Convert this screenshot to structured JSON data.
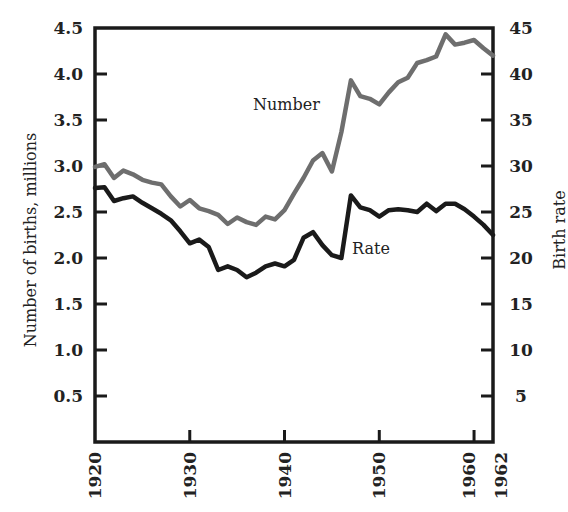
{
  "chart_data": {
    "type": "line",
    "title": "",
    "xlabel": "",
    "ylabel": "Number of births, millions",
    "y2label": "Birth rate",
    "x_ticks": [
      "1920",
      "1930",
      "1940",
      "1950",
      "1960",
      "1962"
    ],
    "y_ticks": [
      "0.5",
      "1.0",
      "1.5",
      "2.0",
      "2.5",
      "3.0",
      "3.5",
      "4.0",
      "4.5"
    ],
    "y2_ticks": [
      "5",
      "10",
      "15",
      "20",
      "25",
      "30",
      "35",
      "40",
      "45"
    ],
    "xlim": [
      1920,
      1962
    ],
    "ylim": [
      0,
      4.5
    ],
    "y2lim": [
      0,
      45
    ],
    "grid": false,
    "annotations": [
      {
        "text": "Number",
        "series": "Number"
      },
      {
        "text": "Rate",
        "series": "Rate"
      }
    ],
    "x": [
      1920,
      1921,
      1922,
      1923,
      1924,
      1925,
      1926,
      1927,
      1928,
      1929,
      1930,
      1931,
      1932,
      1933,
      1934,
      1935,
      1936,
      1937,
      1938,
      1939,
      1940,
      1941,
      1942,
      1943,
      1944,
      1945,
      1946,
      1947,
      1948,
      1949,
      1950,
      1951,
      1952,
      1953,
      1954,
      1955,
      1956,
      1957,
      1958,
      1959,
      1960,
      1961,
      1962
    ],
    "series": [
      {
        "name": "Number",
        "axis": "left",
        "unit": "millions",
        "color": "#6e6e6e",
        "values": [
          2.99,
          3.02,
          2.87,
          2.95,
          2.91,
          2.85,
          2.82,
          2.8,
          2.67,
          2.56,
          2.63,
          2.54,
          2.51,
          2.47,
          2.37,
          2.44,
          2.39,
          2.36,
          2.45,
          2.42,
          2.52,
          2.7,
          2.87,
          3.06,
          3.14,
          2.94,
          3.37,
          3.93,
          3.76,
          3.73,
          3.67,
          3.8,
          3.91,
          3.96,
          4.12,
          4.15,
          4.19,
          4.43,
          4.32,
          4.34,
          4.37,
          4.28,
          4.2
        ]
      },
      {
        "name": "Rate",
        "axis": "right",
        "unit": "per 1000",
        "color": "#1a1a1a",
        "values": [
          27.6,
          27.7,
          26.2,
          26.5,
          26.7,
          26.0,
          25.4,
          24.8,
          24.1,
          22.9,
          21.6,
          22.0,
          21.2,
          18.7,
          19.1,
          18.7,
          17.9,
          18.4,
          19.1,
          19.4,
          19.1,
          19.8,
          22.2,
          22.8,
          21.4,
          20.3,
          20.0,
          26.8,
          25.5,
          25.2,
          24.5,
          25.2,
          25.3,
          25.2,
          25.0,
          25.9,
          25.1,
          25.9,
          25.9,
          25.3,
          24.5,
          23.6,
          22.5
        ]
      }
    ]
  },
  "axes": {
    "left_title": "Number of births, millions",
    "right_title": "Birth rate"
  },
  "labels": {
    "number": "Number",
    "rate": "Rate"
  }
}
